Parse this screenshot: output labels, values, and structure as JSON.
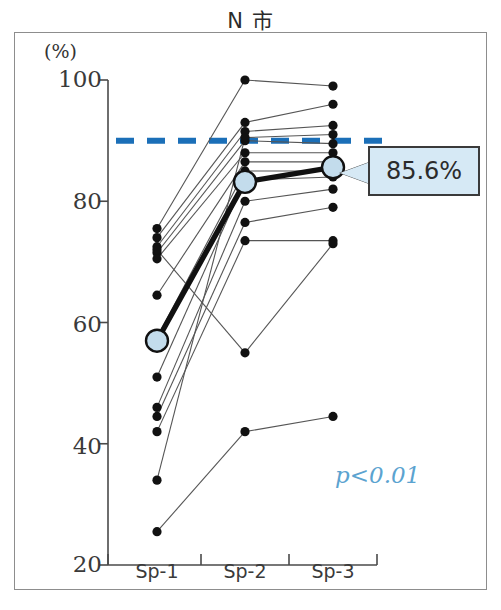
{
  "title": "N 市",
  "axis": {
    "unit_label": "(%)",
    "y_ticks": [
      "100",
      "80",
      "60",
      "40",
      "20"
    ],
    "x_ticks": [
      "Sp-1",
      "Sp-2",
      "Sp-3"
    ]
  },
  "annotations": {
    "callout_value": "85.6%",
    "p_value": "p<0.01",
    "threshold_label": "90"
  },
  "colors": {
    "threshold_line": "#1b6fb8",
    "mean_marker_fill": "#c3dcec",
    "callout_fill": "#d6e9f5",
    "p_value_text": "#5ba3d0",
    "point": "#111111",
    "connector": "#555555",
    "frame": "#8d8d8d"
  },
  "chart_data": {
    "type": "line",
    "title": "N 市",
    "xlabel": "",
    "ylabel": "(%)",
    "categories": [
      "Sp-1",
      "Sp-2",
      "Sp-3"
    ],
    "ylim": [
      20,
      100
    ],
    "yticks": [
      20,
      40,
      60,
      80,
      100
    ],
    "grid": false,
    "legend": "none",
    "threshold_line": {
      "value": 90,
      "style": "dashed",
      "color": "#1b6fb8"
    },
    "annotation_text": "p<0.01",
    "mean_series": {
      "name": "Mean",
      "values": [
        57.0,
        83.2,
        85.6
      ],
      "label_last": "85.6%",
      "marker": "large-circle"
    },
    "series": [
      {
        "name": "case-1",
        "values": [
          75.5,
          100.0,
          99.0
        ]
      },
      {
        "name": "case-2",
        "values": [
          74.0,
          93.0,
          96.0
        ]
      },
      {
        "name": "case-3",
        "values": [
          72.5,
          91.5,
          92.5
        ]
      },
      {
        "name": "case-4",
        "values": [
          71.5,
          90.0,
          89.5
        ]
      },
      {
        "name": "case-5",
        "values": [
          70.5,
          88.0,
          88.0
        ]
      },
      {
        "name": "case-6",
        "values": [
          64.5,
          86.5,
          86.5
        ]
      },
      {
        "name": "case-7",
        "values": [
          57.5,
          85.0,
          85.0
        ]
      },
      {
        "name": "case-8",
        "values": [
          51.0,
          83.5,
          84.0
        ]
      },
      {
        "name": "case-9",
        "values": [
          46.0,
          80.0,
          82.0
        ]
      },
      {
        "name": "case-10",
        "values": [
          44.5,
          76.5,
          79.0
        ]
      },
      {
        "name": "case-11",
        "values": [
          42.0,
          73.5,
          73.5
        ]
      },
      {
        "name": "case-12",
        "values": [
          34.0,
          90.5,
          91.0
        ]
      },
      {
        "name": "case-13",
        "values": [
          72.0,
          55.0,
          73.0
        ]
      },
      {
        "name": "case-14",
        "values": [
          25.5,
          42.0,
          44.5
        ]
      }
    ]
  }
}
